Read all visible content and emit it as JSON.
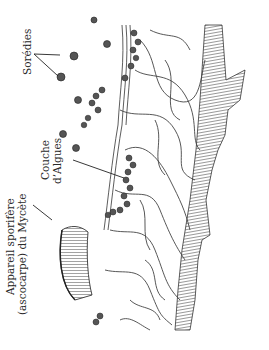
{
  "figure": {
    "type": "lichen thallus cross-section illustration",
    "labels": {
      "soredia": "Sorédies",
      "algae_layer_line1": "Couche",
      "algae_layer_line2": "d’Algues",
      "ascocarp_line1": "Appareil sporifère",
      "ascocarp_line2": "(ascocarpe) du Mycète"
    },
    "colors": {
      "ink": "#2a2a2a",
      "hyphae_fill": "#ffffff",
      "algae_cell": "#555555",
      "background": "#ffffff"
    }
  }
}
